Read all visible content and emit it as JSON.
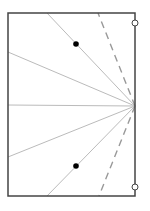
{
  "diagram": {
    "title": "",
    "canvas": {
      "width": 150,
      "height": 211,
      "background": "#ffffff"
    },
    "frame": {
      "x1": 8,
      "y1": 13,
      "x2": 135,
      "y2": 196,
      "stroke": "#444444",
      "stroke_width": 1.5
    },
    "fan_center": {
      "x": 135,
      "y": 106
    },
    "fan_lines": [
      {
        "id": "ray-top",
        "x": 47,
        "y": 13
      },
      {
        "id": "ray-upper",
        "x": 8,
        "y": 52
      },
      {
        "id": "ray-middle",
        "x": 8,
        "y": 105
      },
      {
        "id": "ray-lower",
        "x": 8,
        "y": 157
      },
      {
        "id": "ray-bottom",
        "x": 47,
        "y": 196
      }
    ],
    "fan_line_color": "#bbbbbb",
    "dashed_lines": [
      {
        "id": "dash-top",
        "x": 98,
        "y": 13
      },
      {
        "id": "dash-bottom",
        "x": 99,
        "y": 196
      }
    ],
    "dashed_color": "#999999",
    "dots": [
      {
        "id": "dot-upper",
        "x": 76,
        "y": 44
      },
      {
        "id": "dot-lower",
        "x": 76,
        "y": 166
      }
    ],
    "dot_color": "#000000",
    "open_circles": [
      {
        "id": "circle-top",
        "x": 135,
        "y": 23
      },
      {
        "id": "circle-bottom",
        "x": 135,
        "y": 187
      }
    ]
  }
}
